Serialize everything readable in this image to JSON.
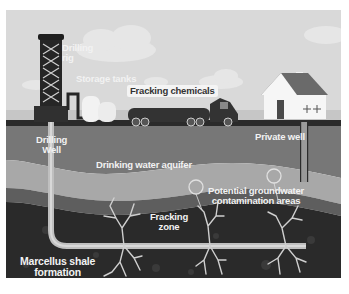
{
  "diagram": {
    "labels": {
      "drilling_rig": [
        "Drilling",
        "rig"
      ],
      "storage_tanks": "Storage tanks",
      "fracking_chemicals": "Fracking chemicals",
      "drilling_well": [
        "Drilling",
        "Well"
      ],
      "private_well": "Private well",
      "aquifer": "Drinking water aquifer",
      "contamination": [
        "Potential groundwater",
        "contamination areas"
      ],
      "fracking_zone": [
        "Fracking",
        "zone"
      ],
      "shale": [
        "Marcellus shale",
        "formation"
      ]
    },
    "colors": {
      "sky": "#d9d9d9",
      "cloud": "#e6e6e6",
      "ground_surface": "#2b2b2b",
      "topsoil": "#777777",
      "aquifer": "#a8a8a8",
      "aquifer_lower_band": "#5e5e5e",
      "shale": "#2a2a2a",
      "pipe": "#bfbfbf",
      "fracture": "#cfcfcf",
      "house_wall": "#f6f6f6",
      "house_roof": "#6a6a6a",
      "rig": "#262626",
      "tank": "#f2f2f2",
      "truck": "#333333"
    }
  }
}
